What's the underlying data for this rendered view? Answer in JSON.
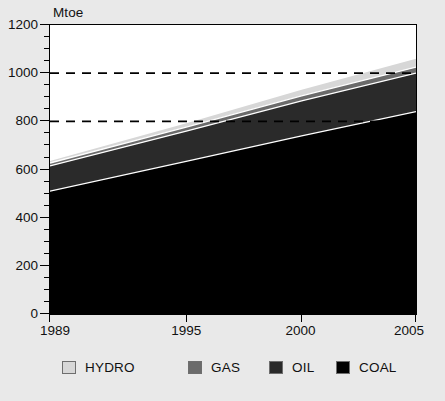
{
  "figure": {
    "background_color": "#e9e9e9",
    "plot_background_color": "#ffffff",
    "frame_color": "#000000"
  },
  "chart_data": {
    "type": "area",
    "stacked": true,
    "title": "",
    "subtitle": "",
    "xlabel": "",
    "ylabel": "Mtoe",
    "unit_label": "Mtoe",
    "x": [
      1989,
      1995,
      2000,
      2005
    ],
    "x_tick_labels": [
      "1989",
      "1995",
      "2000",
      "2005"
    ],
    "xlim": [
      1989,
      2005
    ],
    "ylim": [
      0,
      1200
    ],
    "y_tick_labels": [
      "0",
      "200",
      "400",
      "600",
      "800",
      "1000",
      "1200"
    ],
    "y_ticks": [
      0,
      200,
      400,
      600,
      800,
      1000,
      1200
    ],
    "y_minor_tick_step": 50,
    "grid": "horizontal-dashed",
    "gridlines": [
      800,
      1000
    ],
    "legend_position": "bottom",
    "series": [
      {
        "name": "COAL",
        "color": "#000000",
        "values": [
          510,
          635,
          740,
          840
        ]
      },
      {
        "name": "OIL",
        "color": "#2a2a2a",
        "values": [
          105,
          125,
          145,
          160
        ]
      },
      {
        "name": "GAS",
        "color": "#6b6b6b",
        "values": [
          12,
          17,
          21,
          25
        ]
      },
      {
        "name": "HYDRO",
        "color": "#d7d7d7",
        "values": [
          8,
          16,
          25,
          35
        ]
      }
    ],
    "cumulative_tops": {
      "COAL": [
        510,
        635,
        740,
        840
      ],
      "OIL": [
        615,
        760,
        885,
        1000
      ],
      "GAS": [
        627,
        777,
        906,
        1025
      ],
      "HYDRO": [
        635,
        793,
        931,
        1060
      ]
    }
  },
  "legend": {
    "items": [
      {
        "label": "HYDRO",
        "color": "#d7d7d7",
        "x": 62
      },
      {
        "label": "GAS",
        "color": "#6b6b6b",
        "x": 188
      },
      {
        "label": "OIL",
        "color": "#2a2a2a",
        "x": 269
      },
      {
        "label": "COAL",
        "color": "#000000",
        "x": 336
      }
    ]
  }
}
